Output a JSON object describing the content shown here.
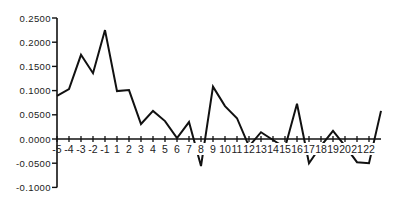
{
  "chart_data": {
    "type": "line",
    "title": "",
    "xlabel": "",
    "ylabel": "",
    "ylim": [
      -0.1,
      0.25
    ],
    "xlim": [
      -5,
      22
    ],
    "grid": false,
    "legend": null,
    "y_ticks": [
      "0.2500",
      "0.2000",
      "0.1500",
      "0.1000",
      "0.0500",
      "0.0000",
      "-0.0500",
      "-0.1000"
    ],
    "y_tick_values": [
      0.25,
      0.2,
      0.15,
      0.1,
      0.05,
      0.0,
      -0.05,
      -0.1
    ],
    "x_ticks": [
      "-5",
      "-4",
      "-3",
      "-2",
      "-1",
      "1",
      "2",
      "3",
      "4",
      "5",
      "6",
      "7",
      "8",
      "9",
      "10",
      "11",
      "12",
      "13",
      "14",
      "15",
      "16",
      "17",
      "18",
      "19",
      "20",
      "21",
      "22"
    ],
    "series": [
      {
        "name": "series-1",
        "color": "#111111",
        "x": [
          -5,
          -4,
          -3,
          -2,
          -1,
          0,
          1,
          2,
          3,
          4,
          5,
          6,
          7,
          8,
          9,
          10,
          11,
          12,
          13,
          14,
          15,
          16,
          17,
          18,
          19,
          20,
          21,
          22
        ],
        "values": [
          0.089,
          0.103,
          0.174,
          0.136,
          0.225,
          0.099,
          0.101,
          0.031,
          0.058,
          0.037,
          0.002,
          0.035,
          -0.056,
          0.108,
          0.068,
          0.043,
          -0.015,
          0.014,
          -0.002,
          -0.018,
          0.073,
          -0.05,
          -0.014,
          0.017,
          -0.014,
          -0.048,
          -0.05,
          0.058
        ]
      }
    ]
  }
}
